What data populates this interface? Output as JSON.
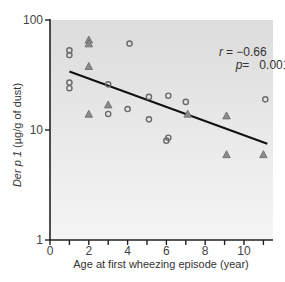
{
  "chart_data": {
    "type": "scatter",
    "title": "",
    "xlabel": "Age at first wheezing episode (year)",
    "ylabel_italic": "Der p 1",
    "ylabel_rest": " (µg/g of dust)",
    "ylabel": "Der p 1 (µg/g of dust)",
    "xlim": [
      0,
      11.5
    ],
    "ylim": [
      1,
      100
    ],
    "yscale": "log",
    "x_ticks": [
      0,
      1,
      2,
      3,
      4,
      5,
      6,
      7,
      8,
      9,
      10,
      11
    ],
    "x_tick_labels": [
      "0",
      "",
      "2",
      "",
      "4",
      "",
      "6",
      "",
      "8",
      "",
      "10",
      ""
    ],
    "y_ticks": [
      1,
      10,
      100
    ],
    "y_tick_labels": [
      "1",
      "10",
      "100"
    ],
    "grid": false,
    "annotations": {
      "r_label": "r",
      "r_value": "= −0.66",
      "p_label": "p",
      "p_value": "=   0.001"
    },
    "series": [
      {
        "name": "circles",
        "marker": "circle",
        "points": [
          [
            1,
            53
          ],
          [
            1,
            48
          ],
          [
            1,
            27
          ],
          [
            1,
            24
          ],
          [
            3,
            26
          ],
          [
            3,
            14
          ],
          [
            4.1,
            61
          ],
          [
            4,
            15.5
          ],
          [
            5.1,
            20
          ],
          [
            5.1,
            12.5
          ],
          [
            6.1,
            20.5
          ],
          [
            6,
            8
          ],
          [
            6.1,
            8.5
          ],
          [
            7,
            18
          ],
          [
            11.1,
            19
          ]
        ]
      },
      {
        "name": "triangles",
        "marker": "triangle",
        "points": [
          [
            2,
            66
          ],
          [
            2,
            61
          ],
          [
            2,
            38
          ],
          [
            2,
            14
          ],
          [
            3,
            17
          ],
          [
            7.1,
            14
          ],
          [
            9.1,
            13.5
          ],
          [
            9.1,
            6
          ],
          [
            11,
            6
          ]
        ]
      }
    ],
    "regression_line": {
      "x": [
        1,
        11.2
      ],
      "y": [
        34,
        7.5
      ]
    }
  },
  "colors": {
    "plot_bg_top": "#dedede",
    "plot_bg_bottom": "#f4f4f4",
    "marker_stroke": "#6a6a6a",
    "marker_fill": "#8a8a8a",
    "line": "#111111",
    "axis": "#222222"
  }
}
